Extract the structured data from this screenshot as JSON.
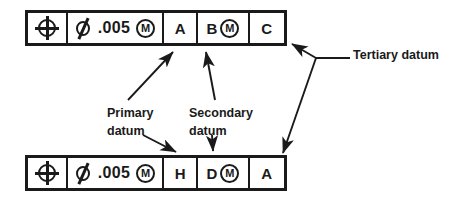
{
  "diagram": {
    "ink_color": "#1a1a1a",
    "background": "#ffffff"
  },
  "frames": [
    {
      "id": "top",
      "name": "upper-feature-control-frame",
      "cells": [
        {
          "type": "symbol",
          "icon": "position-symbol",
          "text": ""
        },
        {
          "type": "tolerance",
          "diameter_icon": "diameter-symbol",
          "value": ".005",
          "modifier": "M",
          "modifier_icon": "mmc-modifier-symbol"
        },
        {
          "type": "datum",
          "letter": "A"
        },
        {
          "type": "datum_mod",
          "letter": "B",
          "modifier": "M",
          "modifier_icon": "mmc-modifier-symbol"
        },
        {
          "type": "datum",
          "letter": "C"
        }
      ]
    },
    {
      "id": "bottom",
      "name": "lower-feature-control-frame",
      "cells": [
        {
          "type": "symbol",
          "icon": "position-symbol",
          "text": ""
        },
        {
          "type": "tolerance",
          "diameter_icon": "diameter-symbol",
          "value": ".005",
          "modifier": "M",
          "modifier_icon": "mmc-modifier-symbol"
        },
        {
          "type": "datum",
          "letter": "H"
        },
        {
          "type": "datum_mod",
          "letter": "D",
          "modifier": "M",
          "modifier_icon": "mmc-modifier-symbol"
        },
        {
          "type": "datum",
          "letter": "A"
        }
      ]
    }
  ],
  "callouts": [
    {
      "id": "primary",
      "label": "Primary\ndatum"
    },
    {
      "id": "secondary",
      "label": "Secondary\ndatum"
    },
    {
      "id": "tertiary",
      "label": "Tertiary datum"
    }
  ]
}
